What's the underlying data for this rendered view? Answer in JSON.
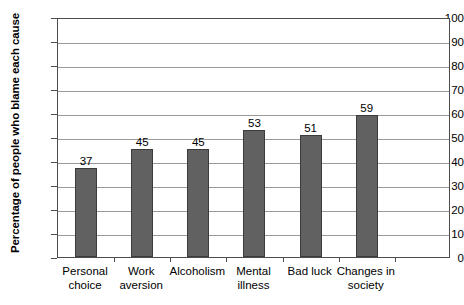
{
  "chart_data": {
    "type": "bar",
    "title": "",
    "xlabel": "",
    "ylabel": "Percentage of people who blame each cause",
    "categories": [
      "Personal choice",
      "Work aversion",
      "Alcoholism",
      "Mental illness",
      "Bad luck",
      "Changes in society"
    ],
    "category_lines": [
      [
        "Personal",
        "choice"
      ],
      [
        "Work",
        "aversion"
      ],
      [
        "Alcoholism",
        ""
      ],
      [
        "Mental",
        "illness"
      ],
      [
        "Bad luck",
        ""
      ],
      [
        "Changes in",
        "society"
      ]
    ],
    "values": [
      37,
      45,
      45,
      53,
      51,
      59
    ],
    "value_labels": [
      "37",
      "45",
      "45",
      "53",
      "51",
      "59"
    ],
    "ylim": [
      0,
      100
    ],
    "ytick_step": 10,
    "yticks": [
      100,
      90,
      80,
      70,
      60,
      50,
      40,
      30,
      20,
      10,
      0
    ],
    "ytick_labels": [
      "100",
      "90",
      "80",
      "70",
      "60",
      "50",
      "40",
      "30",
      "20",
      "10",
      "0"
    ],
    "grid": true,
    "legend": false,
    "colors": {
      "bar_fill": "#616161",
      "bar_edge": "#3b3b3b",
      "gridline": "#9a9a9a",
      "axis": "#4d4d4d",
      "text": "#000000",
      "background": "#ffffff"
    }
  }
}
